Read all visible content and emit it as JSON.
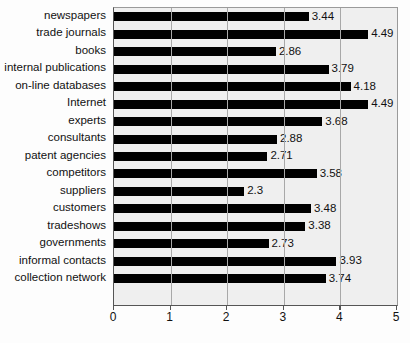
{
  "chart_data": {
    "type": "bar",
    "orientation": "horizontal",
    "title": "",
    "subtitle": "",
    "xlabel": "",
    "ylabel": "",
    "xlim": [
      0,
      5
    ],
    "xticks": [
      "0",
      "1",
      "2",
      "3",
      "4",
      "5"
    ],
    "grid": "vertical",
    "legend": "none",
    "bar_color": "#000000",
    "plot_background": "#efefef",
    "categories": [
      "newspapers",
      "trade journals",
      "books",
      "internal publications",
      "on-line databases",
      "Internet",
      "experts",
      "consultants",
      "patent agencies",
      "competitors",
      "suppliers",
      "customers",
      "tradeshows",
      "governments",
      "informal contacts",
      "collection network"
    ],
    "values": [
      3.44,
      4.49,
      2.86,
      3.79,
      4.18,
      4.49,
      3.68,
      2.88,
      2.71,
      3.58,
      2.3,
      3.48,
      3.38,
      2.73,
      3.93,
      3.74
    ],
    "value_labels": [
      "3.44",
      "4.49",
      "2.86",
      "3.79",
      "4.18",
      "4.49",
      "3.68",
      "2.88",
      "2.71",
      "3.58",
      "2.3",
      "3.48",
      "3.38",
      "2.73",
      "3.93",
      "3.74"
    ]
  }
}
